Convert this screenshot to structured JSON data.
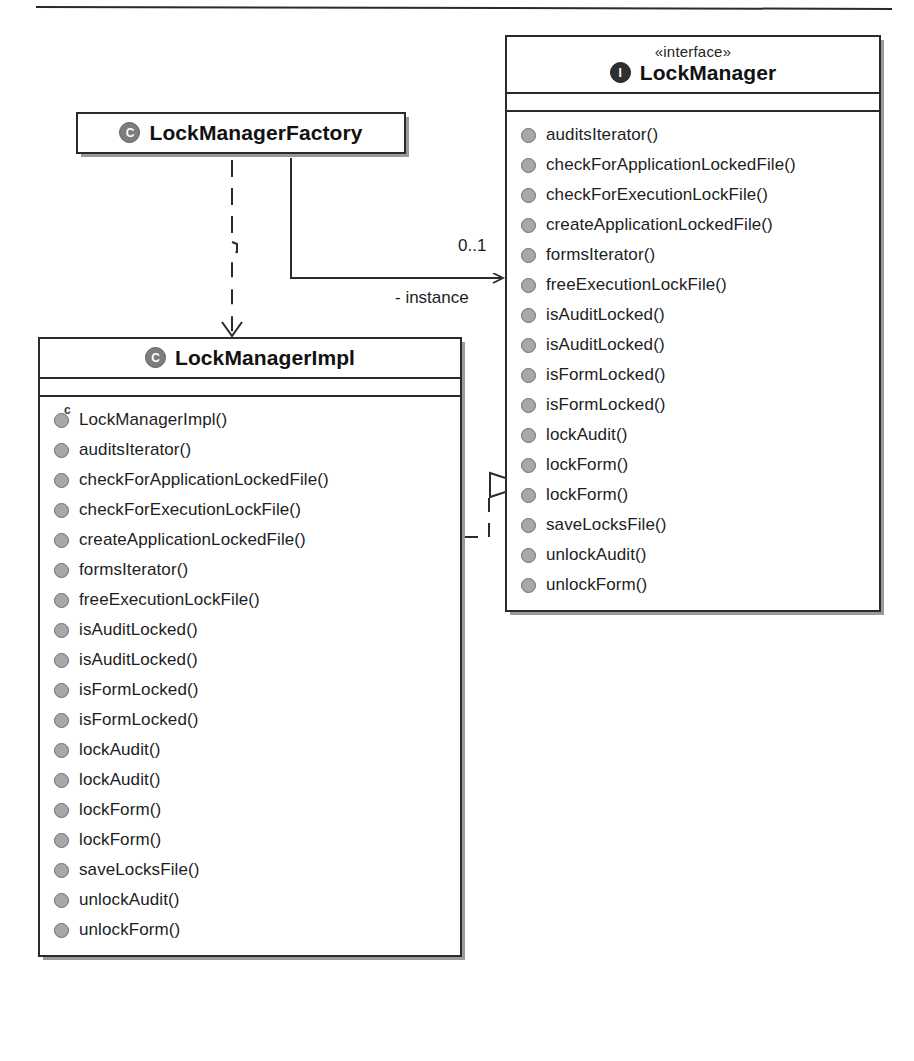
{
  "diagram": {
    "kind": "uml-class-diagram",
    "colors": {
      "line": "#2b2b2b",
      "box_fill": "#ffffff",
      "class_icon": "#7d7d7d",
      "interface_icon": "#303030",
      "bullet": "#a8a8a8",
      "shadow": "#9a9a9a"
    }
  },
  "classes": {
    "factory": {
      "icon": "class-circle-icon",
      "name": "LockManagerFactory",
      "stereotype": "",
      "operations": []
    },
    "impl": {
      "icon": "class-circle-icon",
      "name": "LockManagerImpl",
      "stereotype": "",
      "operations": [
        {
          "label": "LockManagerImpl()",
          "kind": "constructor"
        },
        {
          "label": "auditsIterator()",
          "kind": "method"
        },
        {
          "label": "checkForApplicationLockedFile()",
          "kind": "method"
        },
        {
          "label": "checkForExecutionLockFile()",
          "kind": "method"
        },
        {
          "label": "createApplicationLockedFile()",
          "kind": "method"
        },
        {
          "label": "formsIterator()",
          "kind": "method"
        },
        {
          "label": "freeExecutionLockFile()",
          "kind": "method"
        },
        {
          "label": "isAuditLocked()",
          "kind": "method"
        },
        {
          "label": "isAuditLocked()",
          "kind": "method"
        },
        {
          "label": "isFormLocked()",
          "kind": "method"
        },
        {
          "label": "isFormLocked()",
          "kind": "method"
        },
        {
          "label": "lockAudit()",
          "kind": "method"
        },
        {
          "label": "lockAudit()",
          "kind": "method"
        },
        {
          "label": "lockForm()",
          "kind": "method"
        },
        {
          "label": "lockForm()",
          "kind": "method"
        },
        {
          "label": "saveLocksFile()",
          "kind": "method"
        },
        {
          "label": "unlockAudit()",
          "kind": "method"
        },
        {
          "label": "unlockForm()",
          "kind": "method"
        }
      ]
    },
    "interface": {
      "icon": "interface-circle-icon",
      "name": "LockManager",
      "stereotype": "«interface»",
      "operations": [
        {
          "label": "auditsIterator()",
          "kind": "method"
        },
        {
          "label": "checkForApplicationLockedFile()",
          "kind": "method"
        },
        {
          "label": "checkForExecutionLockFile()",
          "kind": "method"
        },
        {
          "label": "createApplicationLockedFile()",
          "kind": "method"
        },
        {
          "label": "formsIterator()",
          "kind": "method"
        },
        {
          "label": "freeExecutionLockFile()",
          "kind": "method"
        },
        {
          "label": "isAuditLocked()",
          "kind": "method"
        },
        {
          "label": "isAuditLocked()",
          "kind": "method"
        },
        {
          "label": "isFormLocked()",
          "kind": "method"
        },
        {
          "label": "isFormLocked()",
          "kind": "method"
        },
        {
          "label": "lockAudit()",
          "kind": "method"
        },
        {
          "label": "lockForm()",
          "kind": "method"
        },
        {
          "label": "lockForm()",
          "kind": "method"
        },
        {
          "label": "saveLocksFile()",
          "kind": "method"
        },
        {
          "label": "unlockAudit()",
          "kind": "method"
        },
        {
          "label": "unlockForm()",
          "kind": "method"
        }
      ]
    }
  },
  "relationships": {
    "association": {
      "from": "LockManagerFactory",
      "to": "LockManager",
      "multiplicity": "0..1",
      "role": "- instance",
      "arrow": "open-arrow"
    },
    "dependency": {
      "from": "LockManagerFactory",
      "to": "LockManagerImpl",
      "style": "dashed",
      "arrow": "open-arrow"
    },
    "realization": {
      "from": "LockManagerImpl",
      "to": "LockManager",
      "style": "dashed",
      "arrow": "hollow-triangle"
    }
  }
}
